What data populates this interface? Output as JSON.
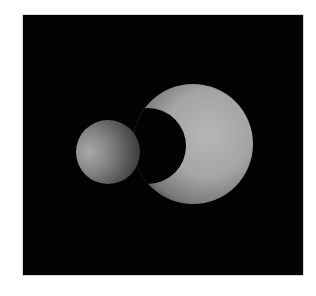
{
  "scene": {
    "background": "#030303",
    "objects": [
      {
        "name": "large-sphere",
        "cx": 193,
        "cy": 144,
        "r": 60,
        "color": "#b8b8b8"
      },
      {
        "name": "small-sphere",
        "cx": 108,
        "cy": 152,
        "r": 32,
        "color": "#8a8a8a"
      },
      {
        "name": "cast-shadow",
        "cx": 150,
        "cy": 150,
        "r": 37,
        "color": "#030303"
      }
    ],
    "light_direction": "left"
  }
}
